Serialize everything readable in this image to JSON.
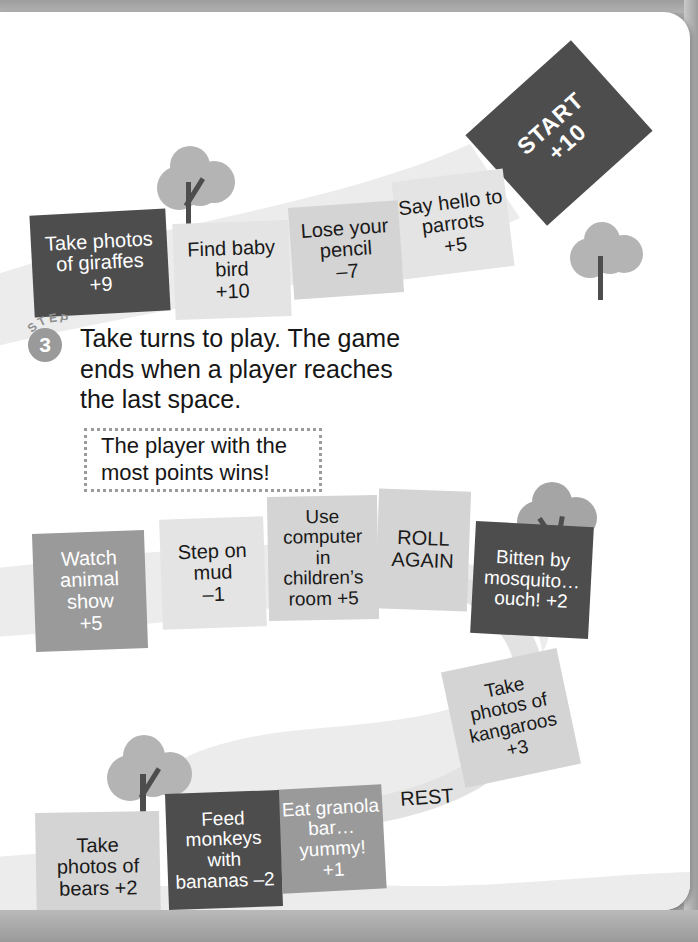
{
  "page": {
    "kind": "printed-workbook-page",
    "background_color": "#a8a8a8",
    "sheet_color": "#ffffff"
  },
  "step": {
    "label": "STEP",
    "number": "3",
    "instruction": "Take turns to play. The game ends when a player reaches the last space.",
    "callout": "The player with the most points wins!"
  },
  "board": {
    "path_color": "#ebebeb",
    "tile_colors": {
      "dark": "#4d4d4d",
      "mid": "#9a9a9a",
      "light": "#d4d4d4",
      "pale": "#e4e4e4"
    },
    "tiles": [
      {
        "id": "start",
        "text": "START\n+10",
        "tone": "dark"
      },
      {
        "id": "parrots",
        "text": "Say hello to\nparrots\n+5",
        "tone": "pale"
      },
      {
        "id": "pencil",
        "text": "Lose your\npencil\n–7",
        "tone": "light"
      },
      {
        "id": "baby-bird",
        "text": "Find baby\nbird\n+10",
        "tone": "pale"
      },
      {
        "id": "giraffes",
        "text": "Take photos\nof giraffes\n+9",
        "tone": "dark"
      },
      {
        "id": "animal-show",
        "text": "Watch\nanimal\nshow\n+5",
        "tone": "mid"
      },
      {
        "id": "mud",
        "text": "Step on\nmud\n–1",
        "tone": "pale"
      },
      {
        "id": "computer",
        "text": "Use\ncomputer\nin\nchildren’s\nroom +5",
        "tone": "light"
      },
      {
        "id": "roll-again",
        "text": "ROLL\nAGAIN",
        "tone": "light"
      },
      {
        "id": "mosquito",
        "text": "Bitten by\nmosquito…\nouch! +2",
        "tone": "dark"
      },
      {
        "id": "kangaroos",
        "text": "Take\nphotos of\nkangaroos\n+3",
        "tone": "light"
      },
      {
        "id": "rest",
        "text": "REST",
        "tone": "plain"
      },
      {
        "id": "granola",
        "text": "Eat granola\nbar…\nyummy!\n+1",
        "tone": "mid"
      },
      {
        "id": "monkeys",
        "text": "Feed\nmonkeys\nwith\nbananas –2",
        "tone": "dark"
      },
      {
        "id": "bears",
        "text": "Take\nphotos of\nbears +2",
        "tone": "light"
      }
    ],
    "trees": [
      {
        "id": "tree-top",
        "canopy_color": "#b4b4b4",
        "trunk_color": "#4d4d4d"
      },
      {
        "id": "tree-top-right",
        "canopy_color": "#b4b4b4",
        "trunk_color": "#4d4d4d"
      },
      {
        "id": "tree-middle-right",
        "canopy_color": "#a5a5a5",
        "trunk_color": "#4d4d4d"
      },
      {
        "id": "tree-bottom-left",
        "canopy_color": "#b4b4b4",
        "trunk_color": "#4d4d4d"
      }
    ]
  }
}
